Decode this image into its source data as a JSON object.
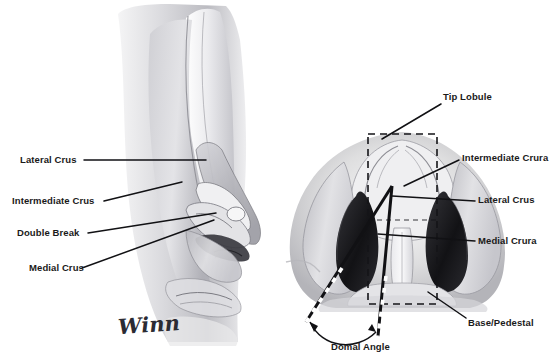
{
  "figure": {
    "background_color": "#ffffff",
    "ink_color": "#1a1a1a",
    "signature": "Winn"
  },
  "lateral_view": {
    "name": "lateral-profile-view",
    "labels": [
      {
        "id": "lateral-crus",
        "text": "Lateral Crus",
        "x": 20,
        "y": 160
      },
      {
        "id": "intermediate-crus",
        "text": "Intermediate Crus",
        "x": 12,
        "y": 201
      },
      {
        "id": "double-break",
        "text": "Double Break",
        "x": 17,
        "y": 233
      },
      {
        "id": "medial-crus",
        "text": "Medial Crus",
        "x": 29,
        "y": 270
      }
    ]
  },
  "base_view": {
    "name": "base-view",
    "labels": [
      {
        "id": "tip-lobule",
        "text": "Tip Lobule",
        "x": 443,
        "y": 97
      },
      {
        "id": "intermediate-crura",
        "text": "Intermediate Crura",
        "x": 462,
        "y": 158
      },
      {
        "id": "lateral-crus-base",
        "text": "Lateral Crus",
        "x": 478,
        "y": 200
      },
      {
        "id": "medial-crura",
        "text": "Medial Crura",
        "x": 478,
        "y": 241
      },
      {
        "id": "base-pedestal",
        "text": "Base/Pedestal",
        "x": 468,
        "y": 323
      },
      {
        "id": "domal-angle",
        "text": "Domal Angle",
        "x": 331,
        "y": 348
      }
    ],
    "annotations": {
      "tip_lobule_box": {
        "x": 368,
        "y": 134,
        "width": 69,
        "height": 170,
        "style": "dashed"
      },
      "domal_angle_arc": {
        "from_deg": 200,
        "to_deg": 340
      }
    }
  },
  "colors": {
    "ink": "#1a1a1a",
    "tissue_light": "#e8e8ea",
    "tissue_mid": "#bdbdc2",
    "tissue_dark": "#8a8a90",
    "cartilage_fill": "#1d1d20",
    "signature": "#2b2b33"
  }
}
